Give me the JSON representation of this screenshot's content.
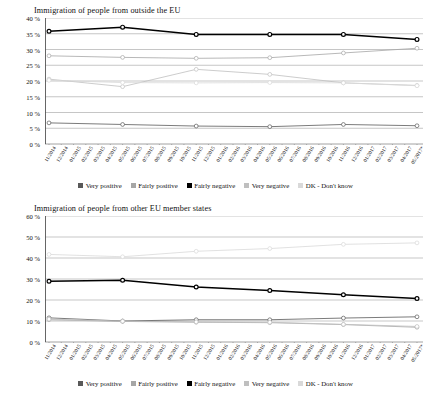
{
  "charts": [
    {
      "title": "Immigration of people from outside the EU",
      "yticks": [
        "0 %",
        "5 %",
        "10 %",
        "15 %",
        "20 %",
        "25 %",
        "30 %",
        "35 %",
        "40 %"
      ]
    },
    {
      "title": "Immigration of people from other EU member states",
      "yticks": [
        "0 %",
        "10 %",
        "20 %",
        "30 %",
        "40 %",
        "50 %",
        "60 %"
      ]
    }
  ],
  "xlabels": [
    "11/2014",
    "12/2014",
    "01/2015",
    "02/2015",
    "03/2015",
    "04/2015",
    "05/2015",
    "06/2015",
    "07/2015",
    "08/2015",
    "09/2015",
    "10/2015",
    "11/2015",
    "12/2015",
    "01/2016",
    "02/2016",
    "03/2016",
    "04/2016",
    "05/2016",
    "06/2016",
    "07/2016",
    "08/2016",
    "09/2016",
    "10/2016",
    "11/2016",
    "12/2016",
    "01/2017",
    "02/2017",
    "03/2017",
    "04/2017",
    "05/2017*"
  ],
  "legend": [
    {
      "label": "Very positive",
      "color": "#595959"
    },
    {
      "label": "Fairly positive",
      "color": "#a6a6a6"
    },
    {
      "label": "Fairly negative",
      "color": "#000000"
    },
    {
      "label": "Very negative",
      "color": "#bfbfbf"
    },
    {
      "label": "DK - Don't know",
      "color": "#d9d9d9"
    }
  ],
  "chart_data": [
    {
      "type": "line",
      "title": "Immigration of people from outside the EU",
      "xlabel": "",
      "ylabel": "",
      "ylim": [
        0,
        40
      ],
      "ytick_step": 5,
      "grid": true,
      "legend_position": "bottom",
      "x": [
        "11/2014",
        "05/2015",
        "11/2015",
        "05/2016",
        "11/2016",
        "05/2017*"
      ],
      "x_index": [
        0,
        6,
        12,
        18,
        24,
        30
      ],
      "series": [
        {
          "name": "Very positive",
          "color": "#595959",
          "values": [
            6.7,
            6.2,
            5.7,
            5.5,
            6.2,
            5.8
          ]
        },
        {
          "name": "Fairly positive",
          "color": "#a6a6a6",
          "values": [
            28.0,
            27.5,
            27.2,
            27.4,
            28.9,
            30.4
          ]
        },
        {
          "name": "Fairly negative",
          "color": "#000000",
          "values": [
            35.8,
            37.1,
            34.8,
            34.8,
            34.8,
            33.2
          ]
        },
        {
          "name": "Very negative",
          "color": "#bfbfbf",
          "values": [
            20.6,
            18.2,
            23.7,
            22.1,
            19.4,
            18.6
          ]
        },
        {
          "name": "DK - Don't know",
          "color": "#d9d9d9",
          "values": [
            20.2,
            19.5,
            19.4,
            19.5,
            19.4,
            18.5
          ]
        }
      ]
    },
    {
      "type": "line",
      "title": "Immigration of people from other EU member states",
      "xlabel": "",
      "ylabel": "",
      "ylim": [
        0,
        60
      ],
      "ytick_step": 10,
      "grid": true,
      "legend_position": "bottom",
      "x": [
        "11/2014",
        "05/2015",
        "11/2015",
        "05/2016",
        "11/2016",
        "05/2017*"
      ],
      "x_index": [
        0,
        6,
        12,
        18,
        24,
        30
      ],
      "series": [
        {
          "name": "Very positive",
          "color": "#595959",
          "values": [
            11.5,
            10.0,
            10.6,
            10.6,
            11.4,
            12.0
          ]
        },
        {
          "name": "Fairly positive",
          "color": "#a6a6a6",
          "values": [
            10.6,
            9.8,
            9.4,
            9.2,
            8.3,
            7.0
          ]
        },
        {
          "name": "Fairly negative",
          "color": "#000000",
          "values": [
            28.9,
            29.4,
            26.2,
            24.5,
            22.5,
            20.7
          ]
        },
        {
          "name": "Very negative",
          "color": "#bfbfbf",
          "values": [
            10.9,
            9.9,
            9.6,
            9.4,
            8.4,
            7.4
          ]
        },
        {
          "name": "DK - Don't know",
          "color": "#d9d9d9",
          "values": [
            41.7,
            40.6,
            43.2,
            44.5,
            46.5,
            47.2
          ]
        }
      ]
    }
  ]
}
